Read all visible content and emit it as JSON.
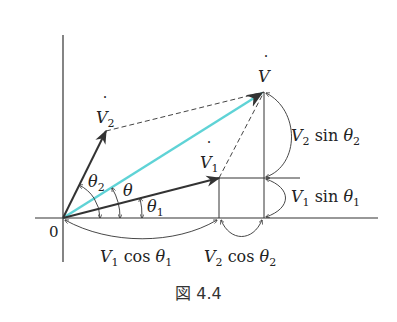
{
  "figure": {
    "caption": "図 4.4",
    "origin_label": "0",
    "colors": {
      "axis": "#333333",
      "vector": "#333333",
      "resultant": "#5fd3d6",
      "dashed": "#444444"
    },
    "vectors": {
      "V": {
        "label": "V",
        "dot": "˙",
        "tip": [
          264,
          92
        ]
      },
      "V1": {
        "label": "V",
        "sub": "1",
        "dot": "˙",
        "tip": [
          219,
          178
        ]
      },
      "V2": {
        "label": "V",
        "sub": "2",
        "dot": "˙",
        "tip": [
          106,
          131
        ]
      }
    },
    "angles": {
      "theta": {
        "label": "θ"
      },
      "theta1": {
        "label": "θ",
        "sub": "1"
      },
      "theta2": {
        "label": "θ",
        "sub": "2"
      }
    },
    "components": {
      "v2_sin": {
        "V": "V",
        "sub": "2",
        "fn": " sin ",
        "theta": "θ",
        "tsub": "2"
      },
      "v1_sin": {
        "V": "V",
        "sub": "1",
        "fn": " sin ",
        "theta": "θ",
        "tsub": "1"
      },
      "v1_cos": {
        "V": "V",
        "sub": "1",
        "fn": " cos ",
        "theta": "θ",
        "tsub": "1"
      },
      "v2_cos": {
        "V": "V",
        "sub": "2",
        "fn": " cos ",
        "theta": "θ",
        "tsub": "2"
      }
    }
  }
}
